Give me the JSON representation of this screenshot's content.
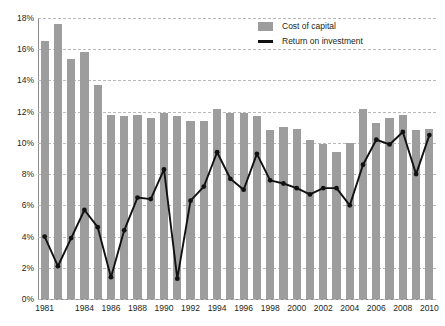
{
  "chart_data": {
    "type": "bar",
    "title": "",
    "subtitle": "",
    "xlabel": "",
    "ylabel": "",
    "ylim": [
      0,
      18
    ],
    "ytick_step": 2,
    "ytick_labels": [
      "0%",
      "2%",
      "4%",
      "6%",
      "8%",
      "10%",
      "12%",
      "14%",
      "16%",
      "18%"
    ],
    "ytick_values": [
      0,
      2,
      4,
      6,
      8,
      10,
      12,
      14,
      16,
      18
    ],
    "grid": true,
    "grid_style": "dashed-horizontal",
    "legend_position": "top-right",
    "categories": [
      "1981",
      "1982",
      "1983",
      "1984",
      "1985",
      "1986",
      "1987",
      "1988",
      "1989",
      "1990",
      "1991",
      "1992",
      "1993",
      "1994",
      "1995",
      "1996",
      "1997",
      "1998",
      "1999",
      "2000",
      "2001",
      "2002",
      "2003",
      "2004",
      "2005",
      "2006",
      "2007",
      "2008",
      "2009",
      "2010"
    ],
    "xtick_labels": [
      "1981",
      "1984",
      "1986",
      "1988",
      "1990",
      "1992",
      "1994",
      "1996",
      "1998",
      "2000",
      "2002",
      "2004",
      "2006",
      "2008",
      "2010"
    ],
    "xtick_categories": [
      "1981",
      "1984",
      "1986",
      "1988",
      "1990",
      "1992",
      "1994",
      "1996",
      "1998",
      "2000",
      "2002",
      "2004",
      "2006",
      "2008",
      "2010"
    ],
    "series": [
      {
        "name": "Cost of capital",
        "type": "bar",
        "color": "#9d9d9d",
        "values": [
          16.5,
          17.6,
          15.4,
          15.8,
          13.7,
          11.8,
          11.7,
          11.8,
          11.6,
          11.9,
          11.7,
          11.4,
          11.4,
          12.2,
          11.9,
          11.9,
          11.7,
          10.8,
          11.0,
          10.9,
          10.2,
          9.9,
          9.4,
          10.0,
          12.2,
          11.3,
          11.6,
          11.8,
          10.8,
          10.9
        ]
      },
      {
        "name": "Return on investment",
        "type": "line",
        "color": "#111111",
        "marker": "circle",
        "values": [
          4.0,
          2.1,
          3.9,
          5.7,
          4.6,
          1.4,
          4.4,
          6.5,
          6.4,
          8.3,
          1.3,
          6.3,
          7.2,
          9.4,
          7.7,
          7.0,
          9.3,
          7.6,
          7.4,
          7.1,
          6.7,
          7.1,
          7.1,
          6.0,
          8.6,
          10.2,
          9.9,
          10.7,
          8.0,
          10.5
        ]
      }
    ]
  },
  "legend": {
    "items": [
      {
        "label": "Cost of capital",
        "swatch": "bar"
      },
      {
        "label": "Return on investment",
        "swatch": "line"
      }
    ]
  }
}
